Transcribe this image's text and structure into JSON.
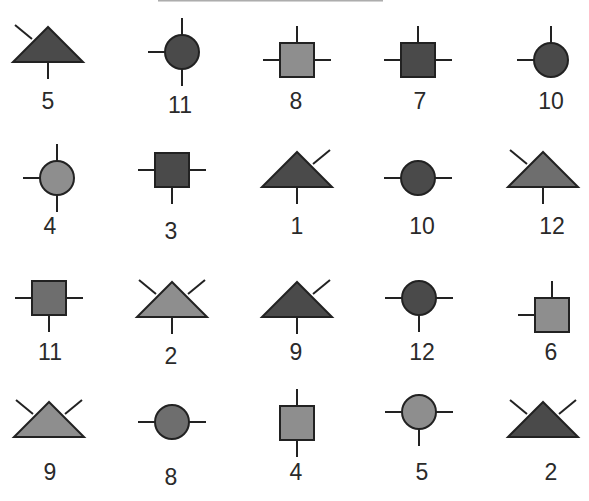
{
  "colors": {
    "dark": "#4a4a4a",
    "medium": "#6e6e6e",
    "light": "#8e8e8e",
    "stroke": "#222222"
  },
  "glyphs": [
    {
      "shape": "triangle",
      "fill": "dark",
      "stems": [
        "ul",
        "bottom"
      ],
      "cx": 48,
      "cy": 45,
      "label": "5",
      "lx": 48,
      "ly": 92
    },
    {
      "shape": "circle",
      "fill": "dark",
      "stems": [
        "top",
        "left",
        "bottom"
      ],
      "cx": 182,
      "cy": 52,
      "label": "11",
      "lx": 180,
      "ly": 96
    },
    {
      "shape": "square",
      "fill": "light",
      "stems": [
        "top",
        "left",
        "right"
      ],
      "cx": 297,
      "cy": 60,
      "label": "8",
      "lx": 296,
      "ly": 92
    },
    {
      "shape": "square",
      "fill": "dark",
      "stems": [
        "top",
        "left",
        "right"
      ],
      "cx": 418,
      "cy": 60,
      "label": "7",
      "lx": 420,
      "ly": 92
    },
    {
      "shape": "circle",
      "fill": "dark",
      "stems": [
        "top",
        "left"
      ],
      "cx": 551,
      "cy": 60,
      "label": "10",
      "lx": 551,
      "ly": 92
    },
    {
      "shape": "circle",
      "fill": "light",
      "stems": [
        "top",
        "left",
        "bottom"
      ],
      "cx": 57,
      "cy": 178,
      "label": "4",
      "lx": 50,
      "ly": 217
    },
    {
      "shape": "square",
      "fill": "dark",
      "stems": [
        "left",
        "right",
        "bottom"
      ],
      "cx": 172,
      "cy": 170,
      "label": "3",
      "lx": 171,
      "ly": 222
    },
    {
      "shape": "triangle",
      "fill": "dark",
      "stems": [
        "ur",
        "bottom"
      ],
      "cx": 297,
      "cy": 170,
      "label": "1",
      "lx": 297,
      "ly": 217
    },
    {
      "shape": "circle",
      "fill": "dark",
      "stems": [
        "left",
        "right"
      ],
      "cx": 418,
      "cy": 178,
      "label": "10",
      "lx": 422,
      "ly": 217
    },
    {
      "shape": "triangle",
      "fill": "medium",
      "stems": [
        "ul",
        "bottom"
      ],
      "cx": 543,
      "cy": 170,
      "label": "12",
      "lx": 552,
      "ly": 217
    },
    {
      "shape": "square",
      "fill": "medium",
      "stems": [
        "left",
        "right",
        "bottom"
      ],
      "cx": 49,
      "cy": 298,
      "label": "11",
      "lx": 50,
      "ly": 343
    },
    {
      "shape": "triangle",
      "fill": "light",
      "stems": [
        "ul",
        "ur",
        "bottom"
      ],
      "cx": 172,
      "cy": 300,
      "label": "2",
      "lx": 171,
      "ly": 347
    },
    {
      "shape": "triangle",
      "fill": "dark",
      "stems": [
        "ur",
        "bottom"
      ],
      "cx": 297,
      "cy": 300,
      "label": "9",
      "lx": 296,
      "ly": 343
    },
    {
      "shape": "circle",
      "fill": "dark",
      "stems": [
        "left",
        "right",
        "bottom"
      ],
      "cx": 419,
      "cy": 298,
      "label": "12",
      "lx": 422,
      "ly": 343
    },
    {
      "shape": "square",
      "fill": "light",
      "stems": [
        "top",
        "left"
      ],
      "cx": 552,
      "cy": 315,
      "label": "6",
      "lx": 551,
      "ly": 343
    },
    {
      "shape": "triangle",
      "fill": "light",
      "stems": [
        "ul",
        "ur"
      ],
      "cx": 49,
      "cy": 420,
      "label": "9",
      "lx": 50,
      "ly": 463
    },
    {
      "shape": "circle",
      "fill": "medium",
      "stems": [
        "left",
        "right"
      ],
      "cx": 172,
      "cy": 422,
      "label": "8",
      "lx": 171,
      "ly": 468
    },
    {
      "shape": "square",
      "fill": "light",
      "stems": [
        "top",
        "bottom"
      ],
      "cx": 297,
      "cy": 423,
      "label": "4",
      "lx": 296,
      "ly": 463
    },
    {
      "shape": "circle",
      "fill": "light",
      "stems": [
        "left",
        "right",
        "bottom"
      ],
      "cx": 419,
      "cy": 412,
      "label": "5",
      "lx": 422,
      "ly": 463
    },
    {
      "shape": "triangle",
      "fill": "dark",
      "stems": [
        "ul",
        "ur"
      ],
      "cx": 543,
      "cy": 420,
      "label": "2",
      "lx": 551,
      "ly": 463
    }
  ]
}
